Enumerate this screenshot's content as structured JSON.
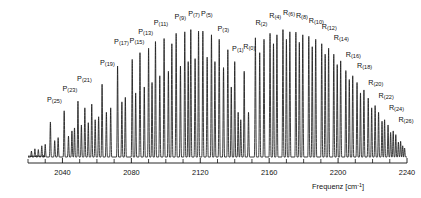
{
  "figure": {
    "kind": "ir-spectrum",
    "line_color": "#1a1a1a",
    "background_color": "#ffffff"
  },
  "axis": {
    "title_text": "Frequenz [cm",
    "title_sup": "-1",
    "title_tail": "]",
    "tick_labels": [
      "2040",
      "2080",
      "2120",
      "2160",
      "2200",
      "2240"
    ],
    "tick_values": [
      2040,
      2080,
      2120,
      2160,
      2200,
      2240
    ],
    "minor_tick_step": 10,
    "range": [
      2020,
      2240
    ]
  },
  "chart_data": {
    "type": "line",
    "title": "",
    "xlabel": "Frequenz [cm-1]",
    "ylabel": "",
    "xlim": [
      2020,
      2240
    ],
    "ylim": [
      0,
      1.0
    ],
    "grid": false,
    "legend": "none",
    "annotations": [
      {
        "label": "P",
        "branch": "P",
        "j": 25,
        "x": 2033.0,
        "peak": 0.235,
        "lx": 2031.0,
        "ly": 0.355
      },
      {
        "label": "P",
        "branch": "P",
        "j": 23,
        "x": 2041.0,
        "peak": 0.31,
        "lx": 2040.0,
        "ly": 0.43
      },
      {
        "label": "P",
        "branch": "P",
        "j": 21,
        "x": 2049.0,
        "peak": 0.375,
        "lx": 2048.5,
        "ly": 0.498
      },
      {
        "label": "P",
        "branch": "P",
        "j": 19,
        "x": 2063.0,
        "peak": 0.488,
        "lx": 2061.8,
        "ly": 0.605
      },
      {
        "label": "P",
        "branch": "P",
        "j": 17,
        "x": 2072.0,
        "peak": 0.61,
        "lx": 2070.0,
        "ly": 0.742
      },
      {
        "label": "P",
        "branch": "P",
        "j": 15,
        "x": 2080.5,
        "peak": 0.655,
        "lx": 2079.0,
        "ly": 0.752
      },
      {
        "label": "P",
        "branch": "P",
        "j": 13,
        "x": 2085.0,
        "peak": 0.7,
        "lx": 2084.0,
        "ly": 0.815
      },
      {
        "label": "P",
        "branch": "P",
        "j": 11,
        "x": 2094.0,
        "peak": 0.775,
        "lx": 2093.0,
        "ly": 0.87
      },
      {
        "label": "P",
        "branch": "P",
        "j": 9,
        "x": 2106.0,
        "peak": 0.83,
        "lx": 2105.0,
        "ly": 0.915
      },
      {
        "label": "P",
        "branch": "P",
        "j": 7,
        "x": 2114.5,
        "peak": 0.855,
        "lx": 2113.0,
        "ly": 0.935
      },
      {
        "label": "P",
        "branch": "P",
        "j": 5,
        "x": 2121.5,
        "peak": 0.845,
        "lx": 2120.5,
        "ly": 0.93
      },
      {
        "label": "P",
        "branch": "P",
        "j": 3,
        "x": 2131.0,
        "peak": 0.79,
        "lx": 2130.0,
        "ly": 0.83
      },
      {
        "label": "P",
        "branch": "P",
        "j": 1,
        "x": 2140.0,
        "peak": 0.64,
        "lx": 2138.5,
        "ly": 0.7
      },
      {
        "label": "R",
        "branch": "R",
        "j": 0,
        "x": 2145.5,
        "peak": 0.575,
        "lx": 2145.0,
        "ly": 0.715
      },
      {
        "label": "R",
        "branch": "R",
        "j": 2,
        "x": 2152.0,
        "peak": 0.8,
        "lx": 2152.0,
        "ly": 0.87
      },
      {
        "label": "R",
        "branch": "R",
        "j": 4,
        "x": 2160.5,
        "peak": 0.83,
        "lx": 2160.0,
        "ly": 0.918
      },
      {
        "label": "R",
        "branch": "R",
        "j": 6,
        "x": 2168.0,
        "peak": 0.855,
        "lx": 2168.0,
        "ly": 0.94
      },
      {
        "label": "R",
        "branch": "R",
        "j": 8,
        "x": 2175.5,
        "peak": 0.838,
        "lx": 2175.5,
        "ly": 0.918
      },
      {
        "label": "R",
        "branch": "R",
        "j": 10,
        "x": 2183.0,
        "peak": 0.81,
        "lx": 2183.0,
        "ly": 0.888
      },
      {
        "label": "R",
        "branch": "R",
        "j": 12,
        "x": 2190.5,
        "peak": 0.76,
        "lx": 2190.5,
        "ly": 0.845
      },
      {
        "label": "R",
        "branch": "R",
        "j": 14,
        "x": 2197.5,
        "peak": 0.69,
        "lx": 2197.5,
        "ly": 0.775
      },
      {
        "label": "R",
        "branch": "R",
        "j": 16,
        "x": 2204.5,
        "peak": 0.58,
        "lx": 2204.5,
        "ly": 0.66
      },
      {
        "label": "R",
        "branch": "R",
        "j": 18,
        "x": 2211.0,
        "peak": 0.5,
        "lx": 2211.0,
        "ly": 0.585
      },
      {
        "label": "R",
        "branch": "R",
        "j": 20,
        "x": 2217.5,
        "peak": 0.395,
        "lx": 2217.5,
        "ly": 0.47
      },
      {
        "label": "R",
        "branch": "R",
        "j": 22,
        "x": 2223.5,
        "peak": 0.3,
        "lx": 2223.5,
        "ly": 0.382
      },
      {
        "label": "R",
        "branch": "R",
        "j": 24,
        "x": 2229.0,
        "peak": 0.215,
        "lx": 2229.5,
        "ly": 0.3
      },
      {
        "label": "R",
        "branch": "R",
        "j": 26,
        "x": 2233.5,
        "peak": 0.15,
        "lx": 2235.0,
        "ly": 0.225
      }
    ],
    "peaks": [
      {
        "x": 2022.0,
        "h": 0.04
      },
      {
        "x": 2024.0,
        "h": 0.055
      },
      {
        "x": 2026.0,
        "h": 0.05
      },
      {
        "x": 2028.0,
        "h": 0.075
      },
      {
        "x": 2030.0,
        "h": 0.085
      },
      {
        "x": 2033.0,
        "h": 0.235
      },
      {
        "x": 2035.5,
        "h": 0.11
      },
      {
        "x": 2037.5,
        "h": 0.13
      },
      {
        "x": 2041.0,
        "h": 0.31
      },
      {
        "x": 2043.5,
        "h": 0.14
      },
      {
        "x": 2045.5,
        "h": 0.175
      },
      {
        "x": 2047.0,
        "h": 0.195
      },
      {
        "x": 2049.0,
        "h": 0.375
      },
      {
        "x": 2051.0,
        "h": 0.215
      },
      {
        "x": 2053.0,
        "h": 0.33
      },
      {
        "x": 2055.0,
        "h": 0.23
      },
      {
        "x": 2057.0,
        "h": 0.355
      },
      {
        "x": 2059.0,
        "h": 0.25
      },
      {
        "x": 2061.0,
        "h": 0.27
      },
      {
        "x": 2063.0,
        "h": 0.488
      },
      {
        "x": 2065.5,
        "h": 0.3
      },
      {
        "x": 2068.0,
        "h": 0.33
      },
      {
        "x": 2072.0,
        "h": 0.61
      },
      {
        "x": 2074.5,
        "h": 0.37
      },
      {
        "x": 2076.5,
        "h": 0.4
      },
      {
        "x": 2080.5,
        "h": 0.655
      },
      {
        "x": 2082.5,
        "h": 0.43
      },
      {
        "x": 2085.0,
        "h": 0.7
      },
      {
        "x": 2087.5,
        "h": 0.47
      },
      {
        "x": 2090.0,
        "h": 0.73
      },
      {
        "x": 2092.0,
        "h": 0.5
      },
      {
        "x": 2094.0,
        "h": 0.775
      },
      {
        "x": 2096.5,
        "h": 0.545
      },
      {
        "x": 2099.0,
        "h": 0.795
      },
      {
        "x": 2101.5,
        "h": 0.575
      },
      {
        "x": 2103.5,
        "h": 0.76
      },
      {
        "x": 2106.0,
        "h": 0.83
      },
      {
        "x": 2108.5,
        "h": 0.61
      },
      {
        "x": 2111.0,
        "h": 0.84
      },
      {
        "x": 2113.0,
        "h": 0.64
      },
      {
        "x": 2114.5,
        "h": 0.855
      },
      {
        "x": 2117.0,
        "h": 0.66
      },
      {
        "x": 2119.0,
        "h": 0.845
      },
      {
        "x": 2121.5,
        "h": 0.845
      },
      {
        "x": 2124.0,
        "h": 0.67
      },
      {
        "x": 2126.5,
        "h": 0.82
      },
      {
        "x": 2128.5,
        "h": 0.64
      },
      {
        "x": 2131.0,
        "h": 0.79
      },
      {
        "x": 2133.5,
        "h": 0.6
      },
      {
        "x": 2136.0,
        "h": 0.72
      },
      {
        "x": 2138.0,
        "h": 0.47
      },
      {
        "x": 2140.0,
        "h": 0.64
      },
      {
        "x": 2142.0,
        "h": 0.3
      },
      {
        "x": 2143.5,
        "h": 0.25
      },
      {
        "x": 2145.5,
        "h": 0.575
      },
      {
        "x": 2148.0,
        "h": 0.3
      },
      {
        "x": 2152.0,
        "h": 0.8
      },
      {
        "x": 2154.5,
        "h": 0.7
      },
      {
        "x": 2157.0,
        "h": 0.79
      },
      {
        "x": 2160.5,
        "h": 0.83
      },
      {
        "x": 2162.5,
        "h": 0.76
      },
      {
        "x": 2164.5,
        "h": 0.82
      },
      {
        "x": 2168.0,
        "h": 0.855
      },
      {
        "x": 2170.0,
        "h": 0.79
      },
      {
        "x": 2172.0,
        "h": 0.84
      },
      {
        "x": 2175.5,
        "h": 0.838
      },
      {
        "x": 2177.5,
        "h": 0.77
      },
      {
        "x": 2179.5,
        "h": 0.82
      },
      {
        "x": 2183.0,
        "h": 0.81
      },
      {
        "x": 2185.0,
        "h": 0.74
      },
      {
        "x": 2187.0,
        "h": 0.79
      },
      {
        "x": 2190.5,
        "h": 0.76
      },
      {
        "x": 2192.5,
        "h": 0.69
      },
      {
        "x": 2194.5,
        "h": 0.73
      },
      {
        "x": 2197.5,
        "h": 0.69
      },
      {
        "x": 2199.5,
        "h": 0.62
      },
      {
        "x": 2201.5,
        "h": 0.645
      },
      {
        "x": 2204.5,
        "h": 0.58
      },
      {
        "x": 2206.5,
        "h": 0.52
      },
      {
        "x": 2208.5,
        "h": 0.545
      },
      {
        "x": 2211.0,
        "h": 0.5
      },
      {
        "x": 2213.0,
        "h": 0.43
      },
      {
        "x": 2215.0,
        "h": 0.45
      },
      {
        "x": 2217.5,
        "h": 0.395
      },
      {
        "x": 2219.5,
        "h": 0.33
      },
      {
        "x": 2221.5,
        "h": 0.345
      },
      {
        "x": 2223.5,
        "h": 0.3
      },
      {
        "x": 2225.5,
        "h": 0.24
      },
      {
        "x": 2227.0,
        "h": 0.25
      },
      {
        "x": 2229.0,
        "h": 0.215
      },
      {
        "x": 2230.5,
        "h": 0.165
      },
      {
        "x": 2232.0,
        "h": 0.175
      },
      {
        "x": 2233.5,
        "h": 0.15
      },
      {
        "x": 2235.0,
        "h": 0.1
      },
      {
        "x": 2236.3,
        "h": 0.105
      },
      {
        "x": 2237.5,
        "h": 0.075
      },
      {
        "x": 2238.6,
        "h": 0.06
      }
    ]
  }
}
